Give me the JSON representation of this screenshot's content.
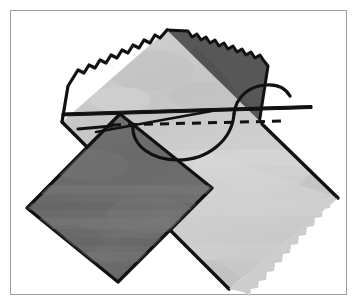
{
  "image": {
    "title": "Hand-sewing two fabric squares together",
    "caption": "Illustration of a needle and thread stitching a running stitch through two overlapping squares of fabric laid on point",
    "background_color": "#ffffff",
    "width": 359,
    "height": 307
  },
  "frame": {
    "name": "illustration-border",
    "stroke_color": "#9e9e9e",
    "fill_color": "#ffffff",
    "stroke_width": 1,
    "inset_px": 10
  },
  "palette": {
    "dark_fabric": "#6e6e6e",
    "dark_fabric_shadow": "#5e5e5e",
    "dark_fabric_highlight": "#7d7d7d",
    "folded_flap": "#575757",
    "light_fabric": "#c9c9c9",
    "light_fabric_shadow": "#bcbcbc",
    "light_fabric_highlight": "#d6d6d6",
    "pale_fabric": "#dcdcdc",
    "outline": "#111111",
    "thread": "#111111"
  },
  "elements": {
    "dark_square": {
      "label": "Dark gray fabric square",
      "fill": "#6e6e6e",
      "outline": "#111111",
      "corners": [
        [
          27,
          208
        ],
        [
          118,
          282
        ],
        [
          212,
          188
        ],
        [
          120,
          114
        ]
      ]
    },
    "light_square": {
      "label": "Light gray fabric square",
      "fill": "#c9c9c9",
      "outline": "#111111",
      "corners": [
        [
          167,
          30
        ],
        [
          338,
          198
        ],
        [
          229,
          289
        ],
        [
          62,
          122
        ]
      ]
    },
    "folded_flap": {
      "label": "Folded dark fabric corner with pinked edge",
      "fill": "#575757",
      "outline": "#111111"
    },
    "pinked_edge": {
      "label": "Pinking-shear zigzag edge",
      "tooth_count": 16,
      "tooth_size_px": 6
    },
    "needle": {
      "label": "Sewing needle",
      "color": "#111111",
      "tip": [
        62,
        113
      ],
      "eye_end": [
        312,
        107
      ],
      "thickness_px": 3
    },
    "thread": {
      "label": "Thread with hanging loop",
      "color": "#111111",
      "thickness_px": 3,
      "loop_left": [
        133,
        126
      ],
      "loop_bottom": [
        185,
        152
      ],
      "loop_right": [
        234,
        118
      ],
      "tail_end": [
        290,
        88
      ]
    },
    "stitch_line": {
      "label": "Running stitch dashed seam line",
      "color": "#111111",
      "dash_pattern": "9 7",
      "thickness_px": 3,
      "start": [
        112,
        125
      ],
      "end": [
        284,
        121
      ]
    }
  },
  "a11y": {
    "alt_text": "Two squares of fabric with pinked edges overlapped on point; a long needle carries dark thread through a dashed running stitch line, with a loop of thread hanging below the seam."
  }
}
